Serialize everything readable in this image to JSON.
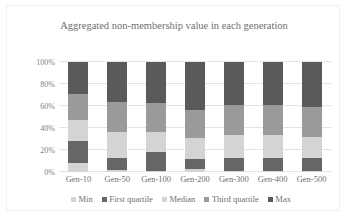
{
  "chart_data": {
    "type": "bar",
    "subtype": "stacked-percent",
    "title": "Aggregated non-membership value in each generation",
    "xlabel": "",
    "ylabel": "",
    "categories": [
      "Gen-10",
      "Gen-50",
      "Gen-100",
      "Gen-200",
      "Gen-300",
      "Gen-400",
      "Gen-500"
    ],
    "ytick_labels": [
      "0%",
      "20%",
      "40%",
      "60%",
      "80%",
      "100%"
    ],
    "ytick_values": [
      0,
      20,
      40,
      60,
      80,
      100
    ],
    "ylim": [
      0,
      100
    ],
    "grid": true,
    "legend_position": "bottom",
    "series": [
      {
        "name": "Min",
        "color": "#d4d4d4",
        "values": [
          8,
          2,
          1,
          3,
          1,
          1,
          1
        ]
      },
      {
        "name": "First quartile",
        "color": "#666666",
        "values": [
          20,
          11,
          17,
          9,
          12,
          12,
          12
        ]
      },
      {
        "name": "Median",
        "color": "#d4d4d4",
        "values": [
          19,
          23,
          18,
          19,
          21,
          21,
          19
        ]
      },
      {
        "name": "Third quartile",
        "color": "#9a9a9a",
        "values": [
          24,
          28,
          27,
          25,
          27,
          27,
          27
        ]
      },
      {
        "name": "Max",
        "color": "#5a5a5a",
        "values": [
          29,
          36,
          37,
          44,
          39,
          39,
          41
        ]
      }
    ]
  },
  "colors": {
    "background": "#ffffff",
    "frame_border": "#f0f0f0",
    "gridline": "#e3e3e3",
    "text": "#6f6f6f",
    "axis_text": "#808080"
  }
}
